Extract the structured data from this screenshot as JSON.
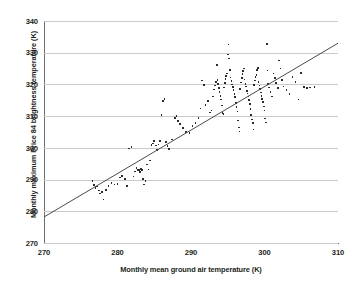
{
  "chart_data": {
    "type": "scatter",
    "title": "",
    "xlabel": "Monthly mean ground air temperature (K)",
    "ylabel": "Monthly maximum Price 84 brightness temperature (K)",
    "xlim": [
      270,
      310
    ],
    "ylim": [
      270,
      340
    ],
    "xticks": [
      270,
      280,
      290,
      300,
      310
    ],
    "yticks": [
      270,
      280,
      290,
      300,
      310,
      320,
      330,
      340
    ],
    "grid": "horizontal",
    "legend": "none",
    "marker_color": "#2b2b2b",
    "grid_color": "#c9cacb",
    "axis_color": "#6d6e71",
    "trend_line": {
      "type": "linear-fit",
      "x_start": 270.0,
      "y_start": 278.2,
      "x_end": 310.0,
      "y_end": 333.0,
      "slope": 1.37,
      "intercept": -91.7,
      "color": "#4b4b4b"
    },
    "points": [
      [
        276.6,
        289.6
      ],
      [
        276.8,
        288.2
      ],
      [
        277.0,
        287.4
      ],
      [
        277.2,
        287.8
      ],
      [
        277.5,
        286.6
      ],
      [
        277.6,
        285.6
      ],
      [
        277.9,
        286.0
      ],
      [
        278.1,
        283.7
      ],
      [
        278.4,
        286.8
      ],
      [
        278.8,
        287.9
      ],
      [
        279.2,
        288.9
      ],
      [
        279.6,
        288.4
      ],
      [
        280.0,
        288.6
      ],
      [
        280.3,
        290.7
      ],
      [
        280.6,
        291.2
      ],
      [
        281.0,
        290.1
      ],
      [
        281.3,
        288.0
      ],
      [
        281.6,
        299.8
      ],
      [
        281.9,
        300.3
      ],
      [
        282.2,
        291.0
      ],
      [
        282.4,
        292.5
      ],
      [
        282.6,
        293.6
      ],
      [
        282.8,
        293.1
      ],
      [
        282.9,
        292.8
      ],
      [
        283.0,
        293.0
      ],
      [
        283.1,
        292.3
      ],
      [
        283.2,
        293.3
      ],
      [
        283.3,
        292.9
      ],
      [
        283.4,
        293.2
      ],
      [
        283.5,
        290.2
      ],
      [
        283.6,
        288.4
      ],
      [
        283.8,
        289.6
      ],
      [
        284.0,
        294.8
      ],
      [
        284.2,
        293.2
      ],
      [
        284.4,
        296.0
      ],
      [
        284.6,
        300.9
      ],
      [
        284.8,
        301.4
      ],
      [
        285.0,
        302.2
      ],
      [
        285.2,
        300.8
      ],
      [
        285.4,
        299.4
      ],
      [
        285.6,
        301.0
      ],
      [
        285.8,
        302.1
      ],
      [
        286.0,
        310.3
      ],
      [
        286.2,
        314.7
      ],
      [
        286.4,
        315.4
      ],
      [
        286.6,
        301.8
      ],
      [
        286.8,
        300.5
      ],
      [
        287.0,
        299.7
      ],
      [
        287.4,
        302.6
      ],
      [
        287.8,
        309.4
      ],
      [
        288.0,
        310.0
      ],
      [
        288.2,
        308.4
      ],
      [
        288.5,
        307.6
      ],
      [
        288.9,
        306.2
      ],
      [
        289.3,
        305.0
      ],
      [
        289.8,
        304.6
      ],
      [
        290.2,
        306.8
      ],
      [
        290.6,
        307.8
      ],
      [
        291.0,
        309.4
      ],
      [
        291.3,
        312.4
      ],
      [
        291.5,
        321.2
      ],
      [
        291.8,
        319.8
      ],
      [
        292.0,
        313.6
      ],
      [
        292.3,
        314.8
      ],
      [
        292.6,
        311.2
      ],
      [
        292.8,
        311.8
      ],
      [
        293.0,
        316.2
      ],
      [
        293.1,
        318.4
      ],
      [
        293.3,
        319.6
      ],
      [
        293.4,
        320.8
      ],
      [
        293.5,
        326.2
      ],
      [
        293.6,
        321.4
      ],
      [
        293.7,
        320.2
      ],
      [
        293.8,
        318.8
      ],
      [
        293.9,
        317.6
      ],
      [
        294.0,
        316.4
      ],
      [
        294.1,
        315.2
      ],
      [
        294.2,
        313.4
      ],
      [
        294.3,
        311.0
      ],
      [
        294.4,
        310.6
      ],
      [
        294.5,
        319.0
      ],
      [
        294.6,
        320.4
      ],
      [
        294.7,
        321.8
      ],
      [
        294.8,
        322.6
      ],
      [
        294.9,
        323.4
      ],
      [
        295.0,
        329.4
      ],
      [
        295.1,
        332.6
      ],
      [
        295.2,
        328.2
      ],
      [
        295.3,
        324.6
      ],
      [
        295.4,
        322.2
      ],
      [
        295.5,
        321.0
      ],
      [
        295.6,
        320.0
      ],
      [
        295.7,
        319.2
      ],
      [
        295.8,
        318.2
      ],
      [
        295.9,
        317.0
      ],
      [
        296.0,
        316.0
      ],
      [
        296.1,
        314.2
      ],
      [
        296.2,
        312.8
      ],
      [
        296.3,
        311.4
      ],
      [
        296.4,
        308.6
      ],
      [
        296.5,
        306.4
      ],
      [
        296.6,
        305.2
      ],
      [
        296.7,
        318.6
      ],
      [
        296.8,
        320.6
      ],
      [
        296.9,
        322.0
      ],
      [
        297.0,
        323.2
      ],
      [
        297.1,
        324.2
      ],
      [
        297.2,
        325.0
      ],
      [
        297.3,
        321.6
      ],
      [
        297.4,
        320.2
      ],
      [
        297.5,
        319.4
      ],
      [
        297.6,
        318.0
      ],
      [
        297.7,
        317.2
      ],
      [
        297.8,
        316.2
      ],
      [
        297.9,
        315.0
      ],
      [
        298.0,
        313.8
      ],
      [
        298.1,
        312.2
      ],
      [
        298.2,
        310.4
      ],
      [
        298.3,
        309.0
      ],
      [
        298.4,
        307.8
      ],
      [
        298.5,
        305.8
      ],
      [
        298.6,
        319.8
      ],
      [
        298.7,
        321.2
      ],
      [
        298.8,
        322.4
      ],
      [
        298.9,
        323.0
      ],
      [
        299.0,
        324.6
      ],
      [
        299.1,
        325.2
      ],
      [
        299.2,
        320.8
      ],
      [
        299.3,
        319.6
      ],
      [
        299.4,
        318.6
      ],
      [
        299.5,
        317.4
      ],
      [
        299.6,
        316.4
      ],
      [
        299.7,
        315.4
      ],
      [
        299.8,
        314.4
      ],
      [
        299.9,
        313.0
      ],
      [
        300.0,
        311.8
      ],
      [
        300.1,
        309.2
      ],
      [
        300.2,
        308.0
      ],
      [
        300.3,
        332.8
      ],
      [
        300.4,
        324.4
      ],
      [
        300.5,
        320.2
      ],
      [
        300.6,
        319.0
      ],
      [
        300.8,
        317.6
      ],
      [
        301.0,
        316.2
      ],
      [
        301.2,
        323.4
      ],
      [
        301.4,
        322.0
      ],
      [
        301.6,
        320.4
      ],
      [
        301.8,
        318.8
      ],
      [
        302.0,
        327.6
      ],
      [
        302.2,
        325.0
      ],
      [
        302.4,
        321.4
      ],
      [
        302.6,
        319.4
      ],
      [
        303.0,
        318.2
      ],
      [
        303.4,
        317.0
      ],
      [
        303.8,
        322.4
      ],
      [
        304.2,
        320.8
      ],
      [
        304.6,
        315.2
      ],
      [
        305.0,
        323.6
      ],
      [
        305.4,
        319.2
      ],
      [
        305.8,
        318.8
      ],
      [
        306.2,
        319.0
      ],
      [
        306.8,
        319.2
      ]
    ]
  }
}
